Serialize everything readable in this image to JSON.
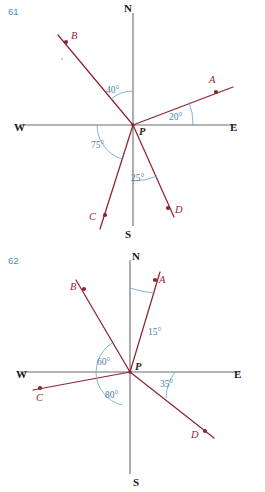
{
  "page": {
    "width": 265,
    "height": 492,
    "background": "#ffffff",
    "colors": {
      "ray": "#8e2433",
      "axis": "#6b6b6b",
      "angle_text": "#4a7fa5",
      "arc": "#6fa8c9",
      "problem_number": "#4a90b8",
      "compass_text": "#1a1a1a"
    }
  },
  "figures": [
    {
      "id": "figure-61",
      "number": "61",
      "center_label": "P",
      "compass": {
        "north": "N",
        "south": "S",
        "east": "E",
        "west": "W"
      },
      "points": [
        {
          "label": "A",
          "bearing_deg": 70,
          "from": "N"
        },
        {
          "label": "B",
          "bearing_deg": 320,
          "from": "N"
        },
        {
          "label": "C",
          "bearing_deg": 195,
          "from": "N"
        },
        {
          "label": "D",
          "bearing_deg": 155,
          "from": "N"
        }
      ],
      "angles": [
        {
          "label": "40°",
          "value": 40,
          "between": "N and PB"
        },
        {
          "label": "20°",
          "value": 20,
          "between": "E and PA"
        },
        {
          "label": "75°",
          "value": 75,
          "between": "W and PC"
        },
        {
          "label": "25°",
          "value": 25,
          "between": "S and PD"
        }
      ]
    },
    {
      "id": "figure-62",
      "number": "62",
      "center_label": "P",
      "compass": {
        "north": "N",
        "south": "S",
        "east": "E",
        "west": "W"
      },
      "points": [
        {
          "label": "A",
          "bearing_deg": 15,
          "from": "N"
        },
        {
          "label": "B",
          "bearing_deg": 330,
          "from": "N"
        },
        {
          "label": "C",
          "bearing_deg": 260,
          "from": "N"
        },
        {
          "label": "D",
          "bearing_deg": 125,
          "from": "N"
        }
      ],
      "angles": [
        {
          "label": "15°",
          "value": 15,
          "between": "N and PA"
        },
        {
          "label": "60°",
          "value": 60,
          "between": "W and PB"
        },
        {
          "label": "35°",
          "value": 35,
          "between": "E and PD"
        },
        {
          "label": "80°",
          "value": 80,
          "between": "W and PC region"
        }
      ]
    }
  ]
}
